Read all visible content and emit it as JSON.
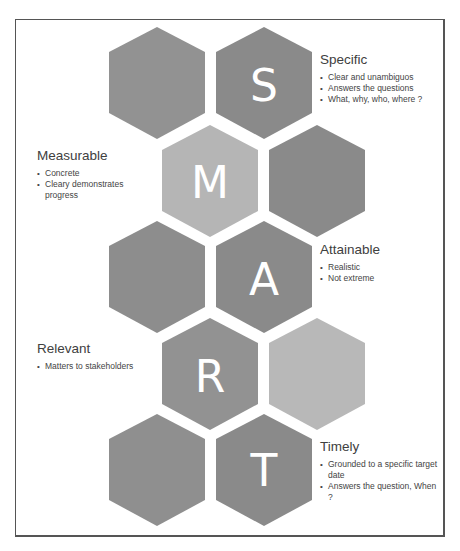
{
  "diagram": {
    "type": "hexagon-grid",
    "colors": {
      "dark": "#8a8a8a",
      "medium": "#929292",
      "light": "#b5b5b5",
      "frame": "#555555",
      "letter": "#ffffff"
    },
    "hexagons": [
      {
        "row": 1,
        "col": 1,
        "letter": "",
        "shade": "medium"
      },
      {
        "row": 1,
        "col": 2,
        "letter": "S",
        "shade": "dark"
      },
      {
        "row": 2,
        "col": 1,
        "letter": "M",
        "shade": "light"
      },
      {
        "row": 2,
        "col": 2,
        "letter": "",
        "shade": "dark"
      },
      {
        "row": 3,
        "col": 1,
        "letter": "",
        "shade": "medium"
      },
      {
        "row": 3,
        "col": 2,
        "letter": "A",
        "shade": "dark"
      },
      {
        "row": 4,
        "col": 1,
        "letter": "R",
        "shade": "medium"
      },
      {
        "row": 4,
        "col": 2,
        "letter": "",
        "shade": "light"
      },
      {
        "row": 5,
        "col": 1,
        "letter": "",
        "shade": "medium"
      },
      {
        "row": 5,
        "col": 2,
        "letter": "T",
        "shade": "dark"
      }
    ],
    "letters": {
      "s": "S",
      "m": "M",
      "a": "A",
      "r": "R",
      "t": "T"
    },
    "labels": {
      "specific": {
        "title": "Specific",
        "bullets": [
          "Clear and unambiguos",
          "Answers the questions",
          "What, why, who, where ?"
        ]
      },
      "measurable": {
        "title": "Measurable",
        "bullets": [
          "Concrete",
          "Cleary demonstrates progress"
        ]
      },
      "attainable": {
        "title": "Attainable",
        "bullets": [
          "Realistic",
          "Not extreme"
        ]
      },
      "relevant": {
        "title": "Relevant",
        "bullets": [
          "Matters to stakeholders"
        ]
      },
      "timely": {
        "title": "Timely",
        "bullets": [
          "Grounded to a specific target date",
          "Answers the question, When ?"
        ]
      }
    }
  }
}
